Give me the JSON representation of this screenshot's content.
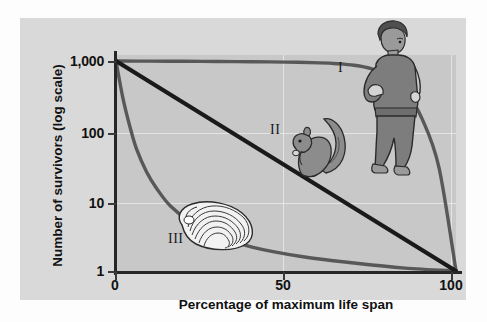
{
  "chart_data": {
    "type": "line",
    "title": "",
    "xlabel": "Percentage of maximum life span",
    "ylabel": "Number of survivors (log scale)",
    "xlim": [
      0,
      100
    ],
    "ylim": [
      1,
      1000
    ],
    "yscale": "log",
    "xticks": [
      "0",
      "50",
      "100"
    ],
    "xtick_values": [
      0,
      50,
      100
    ],
    "yticks": [
      "1,000",
      "100",
      "10",
      "1"
    ],
    "ytick_values": [
      1000,
      100,
      10,
      1
    ],
    "grid": true,
    "legend": "none",
    "series": [
      {
        "name": "I",
        "label": "I",
        "annotation": "Type I survivorship (human)",
        "color": "#585858",
        "x": [
          0,
          10,
          20,
          30,
          40,
          50,
          60,
          65,
          70,
          75,
          80,
          85,
          90,
          95,
          100
        ],
        "y": [
          1000,
          995,
          990,
          985,
          975,
          965,
          940,
          915,
          870,
          780,
          620,
          380,
          150,
          30,
          1
        ]
      },
      {
        "name": "II",
        "label": "II",
        "annotation": "Type II survivorship (squirrel)",
        "color": "#1a1a1a",
        "x": [
          0,
          25,
          50,
          75,
          100
        ],
        "y": [
          1000,
          178,
          31.6,
          5.62,
          1
        ]
      },
      {
        "name": "III",
        "label": "III",
        "annotation": "Type III survivorship (oyster)",
        "color": "#585858",
        "x": [
          0,
          2,
          4,
          6,
          9,
          12,
          16,
          22,
          30,
          40,
          55,
          70,
          85,
          100
        ],
        "y": [
          1000,
          300,
          120,
          56,
          26,
          15,
          8.5,
          5,
          3.2,
          2.2,
          1.6,
          1.3,
          1.1,
          1
        ]
      }
    ],
    "illustrations": [
      {
        "name": "human",
        "curve": "I",
        "x": 88,
        "y": 400
      },
      {
        "name": "squirrel",
        "curve": "II",
        "x": 52,
        "y": 95
      },
      {
        "name": "oyster",
        "curve": "III",
        "x": 32,
        "y": 3.2
      }
    ]
  },
  "axes": {
    "y_title": "Number of survivors (log scale)",
    "x_title": "Percentage of maximum life span",
    "y_ticks": [
      {
        "label": "1,000"
      },
      {
        "label": "100"
      },
      {
        "label": "10"
      },
      {
        "label": "1"
      }
    ],
    "x_ticks": [
      {
        "label": "0"
      },
      {
        "label": "50"
      },
      {
        "label": "100"
      }
    ]
  },
  "curve_labels": {
    "one": "I",
    "two": "II",
    "three": "III"
  },
  "colors": {
    "figure_background": "#d9d9d9",
    "plot_background": "#c8c8c8",
    "axis": "#262626",
    "curve_light": "#585858",
    "curve_dark": "#1a1a1a",
    "gridline": "#eeeeee",
    "illustration_fill": "#8c8c8c",
    "illustration_outline": "#2b2b2b"
  }
}
